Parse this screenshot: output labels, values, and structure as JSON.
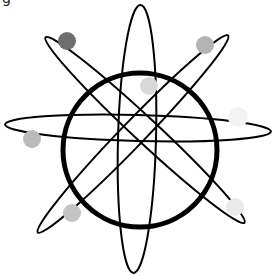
{
  "diagram": {
    "corner_glyph": "g",
    "colors": {
      "background": "#ffffff",
      "stroke": "#000000"
    },
    "nucleus_ring": {
      "cx": 140,
      "cy": 150,
      "r": 77,
      "stroke_width": 5
    },
    "orbits": [
      {
        "name": "vertical",
        "cx": 137,
        "cy": 139,
        "rx": 19,
        "ry": 134,
        "rotate": 1.5
      },
      {
        "name": "horizontal",
        "cx": 138,
        "cy": 128,
        "rx": 133,
        "ry": 13,
        "rotate": 1.5
      },
      {
        "name": "diagonal-nw-se",
        "cx": 145,
        "cy": 130,
        "rx": 136,
        "ry": 12,
        "rotate": 43
      },
      {
        "name": "diagonal-ne-sw",
        "cx": 133,
        "cy": 134,
        "rx": 137,
        "ry": 12,
        "rotate": -46
      }
    ],
    "electrons": [
      {
        "cx": 67,
        "cy": 41,
        "r": 9,
        "color": "#6e6e6e"
      },
      {
        "cx": 205,
        "cy": 45,
        "r": 9,
        "color": "#b4b4b4"
      },
      {
        "cx": 149,
        "cy": 86,
        "r": 9,
        "color": "#d8d8d8"
      },
      {
        "cx": 238,
        "cy": 117,
        "r": 10,
        "color": "#f3f3f3"
      },
      {
        "cx": 32,
        "cy": 139,
        "r": 9,
        "color": "#bababa"
      },
      {
        "cx": 72,
        "cy": 213,
        "r": 9,
        "color": "#c3c3c3"
      },
      {
        "cx": 235,
        "cy": 207,
        "r": 9,
        "color": "#ebebeb"
      }
    ]
  }
}
